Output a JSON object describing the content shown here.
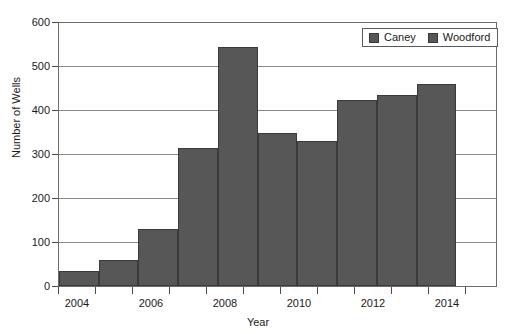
{
  "chart_data": {
    "type": "bar",
    "title": "",
    "xlabel": "Year",
    "ylabel": "Number of Wells",
    "categories": [
      2004,
      2005,
      2006,
      2007,
      2008,
      2009,
      2010,
      2011,
      2012,
      2013
    ],
    "values": [
      35,
      60,
      130,
      315,
      545,
      350,
      330,
      425,
      435,
      460
    ],
    "series": [
      {
        "name": "Caney",
        "categories": [
          2004,
          2005,
          2006,
          2007,
          2008,
          2009,
          2010,
          2011,
          2012,
          2013
        ],
        "values": [
          35,
          60,
          130,
          315,
          545,
          350,
          330,
          425,
          435,
          460
        ]
      },
      {
        "name": "Woodford",
        "categories": [
          2004,
          2005,
          2006,
          2007,
          2008,
          2009,
          2010,
          2011,
          2012,
          2013
        ],
        "values": [
          35,
          60,
          130,
          315,
          545,
          350,
          330,
          425,
          435,
          460
        ]
      }
    ],
    "xlim": [
      2003.5,
      2015.0
    ],
    "ylim": [
      0,
      600
    ],
    "y_ticks": [
      0,
      100,
      200,
      300,
      400,
      500,
      600
    ],
    "y_tick_labels": [
      "0",
      "100",
      "200",
      "300",
      "400",
      "500",
      "600"
    ],
    "x_ticks": [
      2004,
      2005,
      2006,
      2007,
      2008,
      2009,
      2010,
      2011,
      2012,
      2013,
      2014,
      2015
    ],
    "x_tick_labels_major": [
      "2004",
      "2006",
      "2008",
      "2010",
      "2012",
      "2014"
    ],
    "grid": "horizontal",
    "legend_position": "top-right",
    "bar_color": "#575757",
    "bar_edge_color": "#3a3a3a",
    "gridline_color": "#8a8a8a",
    "axis_color": "#6b6b6b"
  },
  "legend": {
    "entries": [
      {
        "label": "Caney",
        "color": "#575757"
      },
      {
        "label": "Woodford",
        "color": "#575757"
      }
    ]
  },
  "axes": {
    "y_title": "Number of Wells",
    "x_title": "Year",
    "y_labels": [
      "600",
      "500",
      "400",
      "300",
      "200",
      "100",
      "0"
    ],
    "x_labels": [
      "2004",
      "2006",
      "2008",
      "2010",
      "2012",
      "2014"
    ]
  }
}
